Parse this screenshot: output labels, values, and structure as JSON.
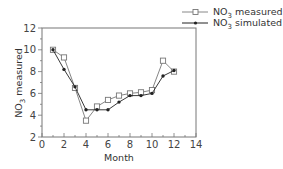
{
  "chart_data": {
    "type": "line",
    "title": "",
    "xlabel": "Month",
    "ylabel": "NO3 measured",
    "ylabel_main": "NO",
    "ylabel_sub": "3",
    "ylabel_rest": " measured",
    "xlim": [
      0,
      14
    ],
    "ylim": [
      2,
      12
    ],
    "xticks": [
      0,
      2,
      4,
      6,
      8,
      10,
      12,
      14
    ],
    "yticks": [
      2,
      4,
      6,
      8,
      10,
      12
    ],
    "grid": false,
    "legend_position": "top-right, outside",
    "x": [
      1,
      2,
      3,
      4,
      5,
      6,
      7,
      8,
      9,
      10,
      11,
      12
    ],
    "series": [
      {
        "name": "NO3 measured",
        "name_main": "NO",
        "name_sub": "3",
        "name_rest": " measured",
        "marker": "open-square",
        "color": "#777777",
        "values": [
          10.0,
          9.3,
          6.5,
          3.5,
          4.8,
          5.4,
          5.8,
          6.0,
          6.1,
          6.3,
          9.0,
          8.0
        ]
      },
      {
        "name": "NO3 simulated",
        "name_main": "NO",
        "name_sub": "3",
        "name_rest": " simulated",
        "marker": "filled-circle",
        "color": "#222222",
        "values": [
          10.0,
          8.2,
          6.6,
          4.5,
          4.5,
          4.5,
          5.2,
          5.8,
          5.8,
          6.0,
          7.6,
          8.1
        ]
      }
    ]
  }
}
